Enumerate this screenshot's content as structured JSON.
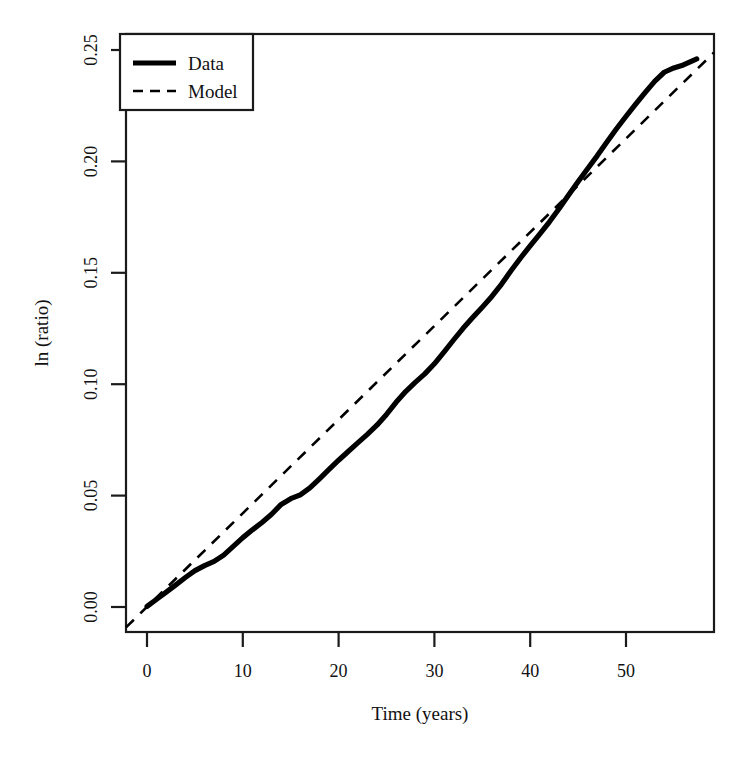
{
  "chart_data": {
    "type": "line",
    "title": "",
    "xlabel": "Time (years)",
    "ylabel": "ln (ratio)",
    "xlim": [
      -2.2,
      59.2
    ],
    "ylim": [
      -0.0112,
      0.2499
    ],
    "xticks": [
      0,
      10,
      20,
      30,
      40,
      50
    ],
    "xtick_labels": [
      "0",
      "10",
      "20",
      "30",
      "40",
      "50"
    ],
    "yticks": [
      0.0,
      0.05,
      0.1,
      0.15,
      0.2,
      0.25
    ],
    "ytick_labels": [
      "0.00",
      "0.05",
      "0.10",
      "0.15",
      "0.20",
      "0.25"
    ],
    "grid": false,
    "legend_position": "top-left",
    "series": [
      {
        "name": "Data",
        "style": "solid",
        "color": "#000000",
        "x": [
          0,
          1,
          2,
          3,
          4,
          5,
          6,
          7,
          8,
          9,
          10,
          11,
          12,
          13,
          14,
          15,
          16,
          17,
          18,
          19,
          20,
          21,
          22,
          23,
          24,
          25,
          26,
          27,
          28,
          29,
          30,
          31,
          32,
          33,
          34,
          35,
          36,
          37,
          38,
          39,
          40,
          41,
          42,
          43,
          44,
          45,
          46,
          47,
          48,
          49,
          50,
          51,
          52,
          53,
          54,
          55,
          56,
          57,
          57.3
        ],
        "values": [
          0.0,
          0.0016,
          0.0032,
          0.0049,
          0.0066,
          0.0082,
          0.0094,
          0.0104,
          0.0119,
          0.0139,
          0.0159,
          0.0177,
          0.0194,
          0.0213,
          0.0236,
          0.0249,
          0.0258,
          0.0274,
          0.0295,
          0.0317,
          0.0338,
          0.0358,
          0.0378,
          0.0398,
          0.0419,
          0.0444,
          0.0472,
          0.0497,
          0.0518,
          0.0538,
          0.0561,
          0.0588,
          0.0616,
          0.0643,
          0.0668,
          0.0692,
          0.0717,
          0.0745,
          0.0776,
          0.0806,
          0.0834,
          0.0861,
          0.0889,
          0.0919,
          0.0951,
          0.0982,
          0.1012,
          0.1042,
          0.1073,
          0.1104,
          0.1133,
          0.1161,
          0.1188,
          0.1214,
          0.1235,
          0.1245,
          0.1252,
          0.1262,
          0.1266
        ]
      },
      {
        "name": "Model",
        "style": "dashed",
        "color": "#000000",
        "x": [
          -2.2,
          59.2
        ],
        "values": [
          -0.0092,
          0.2418
        ]
      }
    ],
    "legend_entries": [
      {
        "label": "Data",
        "style": "solid"
      },
      {
        "label": "Model",
        "style": "dashed"
      }
    ]
  },
  "series_full": {
    "data_x": [
      0,
      1,
      2,
      3,
      4,
      5,
      6,
      7,
      8,
      9,
      10,
      11,
      12,
      13,
      14,
      15,
      16,
      17,
      18,
      19,
      20,
      21,
      22,
      23,
      24,
      25,
      26,
      27,
      28,
      29,
      30,
      31,
      32,
      33,
      34,
      35,
      36,
      37,
      38,
      39,
      40,
      41,
      42,
      43,
      44,
      45,
      46,
      47,
      48,
      49,
      50,
      51,
      52,
      53,
      54,
      55,
      56,
      57,
      57.4
    ],
    "data_y": [
      0.0,
      0.0031,
      0.0062,
      0.0094,
      0.0126,
      0.0156,
      0.0178,
      0.0196,
      0.0224,
      0.0262,
      0.03,
      0.0334,
      0.0366,
      0.0402,
      0.0445,
      0.047,
      0.0487,
      0.0517,
      0.0557,
      0.0598,
      0.0638,
      0.0676,
      0.0714,
      0.0751,
      0.0791,
      0.0838,
      0.0891,
      0.0938,
      0.0978,
      0.1015,
      0.1059,
      0.111,
      0.1163,
      0.1214,
      0.1261,
      0.1306,
      0.1353,
      0.1406,
      0.1465,
      0.1521,
      0.1574,
      0.1625,
      0.1678,
      0.1735,
      0.1795,
      0.1854,
      0.1911,
      0.1967,
      0.2026,
      0.2084,
      0.2139,
      0.2192,
      0.2243,
      0.2292,
      0.2332,
      0.2351,
      0.2364,
      0.2383,
      0.239
    ],
    "model_x": [
      -2.2,
      59.2
    ],
    "model_y": [
      -0.0092,
      0.2418
    ]
  }
}
